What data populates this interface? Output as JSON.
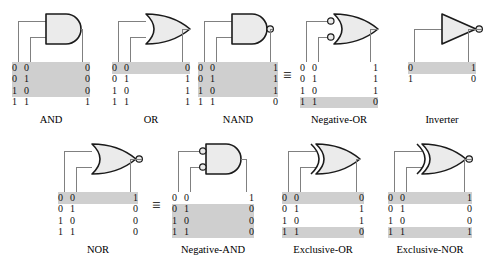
{
  "figure": {
    "colors": {
      "shade": "#cfcfcf",
      "gate_fill": "#ebebeb",
      "gate_stroke": "#1a1a1a",
      "wire": "#808080",
      "text": "#111111"
    },
    "equivalence_symbol": "≡"
  },
  "equivalences": [
    {
      "name": "nand-equals-negative-or",
      "symbol": "≡",
      "left": 283,
      "top": 68
    },
    {
      "name": "nor-equals-negative-and",
      "symbol": "≡",
      "left": 152,
      "top": 198
    }
  ],
  "gates": [
    {
      "id": "and",
      "caption": "AND",
      "shape": "and",
      "input_bubbles": false,
      "output_bubble": false,
      "inputs": 2,
      "headers": [
        "A",
        "B",
        "X"
      ],
      "rows": [
        {
          "in": [
            "0",
            "0"
          ],
          "out": "0",
          "shaded": true
        },
        {
          "in": [
            "0",
            "1"
          ],
          "out": "0",
          "shaded": true
        },
        {
          "in": [
            "1",
            "0"
          ],
          "out": "0",
          "shaded": true
        },
        {
          "in": [
            "1",
            "1"
          ],
          "out": "1",
          "shaded": false
        }
      ]
    },
    {
      "id": "or",
      "caption": "OR",
      "shape": "or",
      "input_bubbles": false,
      "output_bubble": false,
      "inputs": 2,
      "headers": [
        "A",
        "B",
        "X"
      ],
      "rows": [
        {
          "in": [
            "0",
            "0"
          ],
          "out": "0",
          "shaded": true
        },
        {
          "in": [
            "0",
            "1"
          ],
          "out": "1",
          "shaded": false
        },
        {
          "in": [
            "1",
            "0"
          ],
          "out": "1",
          "shaded": false
        },
        {
          "in": [
            "1",
            "1"
          ],
          "out": "1",
          "shaded": false
        }
      ]
    },
    {
      "id": "nand",
      "caption": "NAND",
      "shape": "and",
      "input_bubbles": false,
      "output_bubble": true,
      "inputs": 2,
      "headers": [
        "A",
        "B",
        "X"
      ],
      "rows": [
        {
          "in": [
            "0",
            "0"
          ],
          "out": "1",
          "shaded": true
        },
        {
          "in": [
            "0",
            "1"
          ],
          "out": "1",
          "shaded": true
        },
        {
          "in": [
            "1",
            "0"
          ],
          "out": "1",
          "shaded": true
        },
        {
          "in": [
            "1",
            "1"
          ],
          "out": "0",
          "shaded": false
        }
      ]
    },
    {
      "id": "negative-or",
      "caption": "Negative-OR",
      "shape": "or",
      "input_bubbles": true,
      "output_bubble": false,
      "inputs": 2,
      "headers": [
        "A",
        "B",
        "X"
      ],
      "rows": [
        {
          "in": [
            "0",
            "0"
          ],
          "out": "1",
          "shaded": false
        },
        {
          "in": [
            "0",
            "1"
          ],
          "out": "1",
          "shaded": false
        },
        {
          "in": [
            "1",
            "0"
          ],
          "out": "1",
          "shaded": false
        },
        {
          "in": [
            "1",
            "1"
          ],
          "out": "0",
          "shaded": true
        }
      ]
    },
    {
      "id": "inverter",
      "caption": "Inverter",
      "shape": "inverter",
      "input_bubbles": false,
      "output_bubble": true,
      "inputs": 1,
      "headers": [
        "A",
        "X"
      ],
      "rows": [
        {
          "in": [
            "0"
          ],
          "out": "1",
          "shaded": true
        },
        {
          "in": [
            "1"
          ],
          "out": "0",
          "shaded": false
        }
      ]
    },
    {
      "id": "nor",
      "caption": "NOR",
      "shape": "or",
      "input_bubbles": false,
      "output_bubble": true,
      "inputs": 2,
      "headers": [
        "A",
        "B",
        "X"
      ],
      "rows": [
        {
          "in": [
            "0",
            "0"
          ],
          "out": "1",
          "shaded": true
        },
        {
          "in": [
            "0",
            "1"
          ],
          "out": "0",
          "shaded": false
        },
        {
          "in": [
            "1",
            "0"
          ],
          "out": "0",
          "shaded": false
        },
        {
          "in": [
            "1",
            "1"
          ],
          "out": "0",
          "shaded": false
        }
      ]
    },
    {
      "id": "negative-and",
      "caption": "Negative-AND",
      "shape": "and",
      "input_bubbles": true,
      "output_bubble": false,
      "inputs": 2,
      "headers": [
        "A",
        "B",
        "X"
      ],
      "rows": [
        {
          "in": [
            "0",
            "0"
          ],
          "out": "1",
          "shaded": false
        },
        {
          "in": [
            "0",
            "1"
          ],
          "out": "0",
          "shaded": true
        },
        {
          "in": [
            "1",
            "0"
          ],
          "out": "0",
          "shaded": true
        },
        {
          "in": [
            "1",
            "1"
          ],
          "out": "0",
          "shaded": true
        }
      ]
    },
    {
      "id": "exclusive-or",
      "caption": "Exclusive-OR",
      "shape": "xor",
      "input_bubbles": false,
      "output_bubble": false,
      "inputs": 2,
      "headers": [
        "A",
        "B",
        "X"
      ],
      "rows": [
        {
          "in": [
            "0",
            "0"
          ],
          "out": "0",
          "shaded": true
        },
        {
          "in": [
            "0",
            "1"
          ],
          "out": "1",
          "shaded": false
        },
        {
          "in": [
            "1",
            "0"
          ],
          "out": "1",
          "shaded": false
        },
        {
          "in": [
            "1",
            "1"
          ],
          "out": "0",
          "shaded": true
        }
      ]
    },
    {
      "id": "exclusive-nor",
      "caption": "Exclusive-NOR",
      "shape": "xor",
      "input_bubbles": false,
      "output_bubble": true,
      "inputs": 2,
      "headers": [
        "A",
        "B",
        "X"
      ],
      "rows": [
        {
          "in": [
            "0",
            "0"
          ],
          "out": "1",
          "shaded": true
        },
        {
          "in": [
            "0",
            "1"
          ],
          "out": "0",
          "shaded": false
        },
        {
          "in": [
            "1",
            "0"
          ],
          "out": "0",
          "shaded": false
        },
        {
          "in": [
            "1",
            "1"
          ],
          "out": "1",
          "shaded": true
        }
      ]
    }
  ],
  "layout": {
    "units": [
      {
        "id": "and",
        "left": 12,
        "top": 10,
        "tableWidth": 78,
        "capTop": 114
      },
      {
        "id": "or",
        "left": 112,
        "top": 10,
        "tableWidth": 78,
        "capTop": 114
      },
      {
        "id": "nand",
        "left": 198,
        "top": 10,
        "tableWidth": 80,
        "capTop": 114
      },
      {
        "id": "negative-or",
        "left": 300,
        "top": 10,
        "tableWidth": 78,
        "capTop": 114
      },
      {
        "id": "inverter",
        "left": 408,
        "top": 10,
        "tableWidth": 68,
        "capTop": 114
      },
      {
        "id": "nor",
        "left": 58,
        "top": 140,
        "tableWidth": 80,
        "capTop": 244
      },
      {
        "id": "negative-and",
        "left": 172,
        "top": 140,
        "tableWidth": 82,
        "capTop": 244
      },
      {
        "id": "exclusive-or",
        "left": 282,
        "top": 140,
        "tableWidth": 82,
        "capTop": 244
      },
      {
        "id": "exclusive-nor",
        "left": 388,
        "top": 140,
        "tableWidth": 84,
        "capTop": 244
      }
    ]
  }
}
